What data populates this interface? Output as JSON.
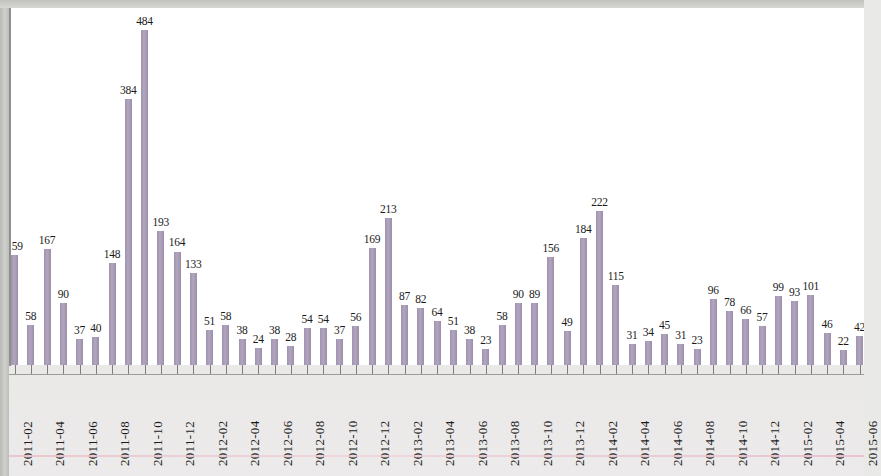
{
  "chart_data": {
    "type": "bar",
    "title": "",
    "subtitle": "",
    "xlabel": "",
    "ylabel": "",
    "ylim": [
      0,
      500
    ],
    "grid": false,
    "legend": "none",
    "bar_color": "#a296b1",
    "label_color": "#1a1a1a",
    "axis_color": "#8e8e8c",
    "categories": [
      "2011-02",
      "2011-03",
      "2011-04",
      "2011-05",
      "2011-06",
      "2011-07",
      "2011-08",
      "2011-09",
      "2011-10",
      "2011-11",
      "2011-12",
      "2012-01",
      "2012-02",
      "2012-03",
      "2012-04",
      "2012-05",
      "2012-06",
      "2012-07",
      "2012-08",
      "2012-09",
      "2012-10",
      "2012-11",
      "2012-12",
      "2013-01",
      "2013-02",
      "2013-03",
      "2013-04",
      "2013-05",
      "2013-06",
      "2013-07",
      "2013-08",
      "2013-09",
      "2013-10",
      "2013-11",
      "2013-12",
      "2014-01",
      "2014-02",
      "2014-03",
      "2014-04",
      "2014-05",
      "2014-06",
      "2014-07",
      "2014-08",
      "2014-09",
      "2014-10",
      "2014-11",
      "2014-12",
      "2015-01",
      "2015-02",
      "2015-03",
      "2015-04",
      "2015-05",
      "2015-06"
    ],
    "values": [
      159,
      58,
      167,
      90,
      37,
      40,
      148,
      384,
      484,
      193,
      164,
      133,
      51,
      58,
      38,
      24,
      38,
      28,
      54,
      54,
      37,
      56,
      169,
      213,
      87,
      82,
      64,
      51,
      38,
      23,
      58,
      90,
      89,
      156,
      49,
      184,
      222,
      115,
      31,
      34,
      45,
      31,
      23,
      96,
      78,
      66,
      57,
      99,
      93,
      101,
      46,
      22,
      42
    ],
    "tick_labels": [
      "2011-02",
      "2011-04",
      "2011-06",
      "2011-08",
      "2011-10",
      "2011-12",
      "2012-02",
      "2012-04",
      "2012-06",
      "2012-08",
      "2012-10",
      "2012-12",
      "2013-02",
      "2013-04",
      "2013-06",
      "2013-08",
      "2013-10",
      "2013-12",
      "2014-02",
      "2014-04",
      "2014-06",
      "2014-08",
      "2014-10",
      "2014-12",
      "2015-02",
      "2015-04",
      "2015-06"
    ],
    "tick_label_interval": 2,
    "tick_label_rotation": -90,
    "data_labels_shown": true,
    "max_value": 484,
    "max_category": "2011-10",
    "min_value": 22,
    "min_category": "2015-05"
  }
}
